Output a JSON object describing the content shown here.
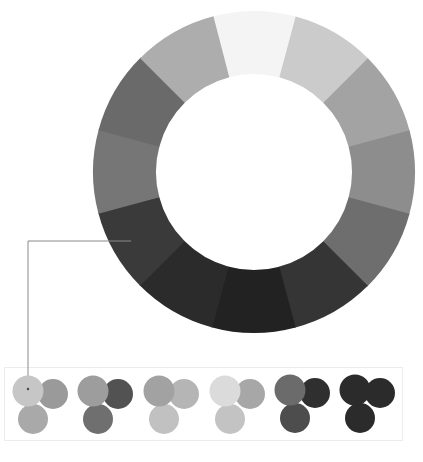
{
  "wheel": {
    "center": [
      254,
      172
    ],
    "outer_radius": 161,
    "inner_radius": 98,
    "segments": [
      {
        "angle": 0,
        "color": "#f4f4f4"
      },
      {
        "angle": 30,
        "color": "#cbcbcb"
      },
      {
        "angle": 60,
        "color": "#a3a3a3"
      },
      {
        "angle": 90,
        "color": "#8d8d8d"
      },
      {
        "angle": 120,
        "color": "#6e6e6e"
      },
      {
        "angle": 150,
        "color": "#353535"
      },
      {
        "angle": 180,
        "color": "#222222"
      },
      {
        "angle": 210,
        "color": "#2b2b2b"
      },
      {
        "angle": 240,
        "color": "#3a3a3a"
      },
      {
        "angle": 270,
        "color": "#767676"
      },
      {
        "angle": 300,
        "color": "#6a6a6a"
      },
      {
        "angle": 330,
        "color": "#adadad"
      }
    ]
  },
  "callout_line": {
    "points": [
      [
        131,
        241
      ],
      [
        28,
        241
      ],
      [
        28,
        389
      ]
    ],
    "color": "#8a8a8a"
  },
  "swatch_groups": [
    {
      "origin": [
        28,
        391
      ],
      "colors": [
        "#c6c6c6",
        "#9a9a9a",
        "#a9a9a9"
      ]
    },
    {
      "origin": [
        93,
        391
      ],
      "colors": [
        "#9d9d9d",
        "#525252",
        "#6f6f6f"
      ]
    },
    {
      "origin": [
        159,
        391
      ],
      "colors": [
        "#a2a2a2",
        "#b5b5b5",
        "#c1c1c1"
      ]
    },
    {
      "origin": [
        225,
        391
      ],
      "colors": [
        "#dbdbdb",
        "#a7a7a7",
        "#c3c3c3"
      ]
    },
    {
      "origin": [
        290,
        390
      ],
      "colors": [
        "#6b6b6b",
        "#2f2f2f",
        "#4d4d4d"
      ]
    },
    {
      "origin": [
        355,
        390
      ],
      "colors": [
        "#2b2b2b",
        "#2b2b2b",
        "#2b2b2b"
      ]
    }
  ]
}
